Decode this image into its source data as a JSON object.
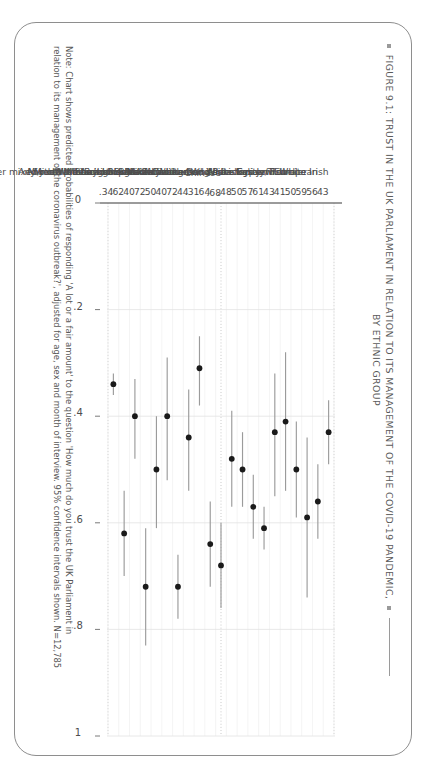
{
  "figure": {
    "title_line1": "FIGURE 9.1: TRUST IN THE UK PARLIAMENT IN RELATION TO ITS MANAGEMENT OF THE COVID-19 PANDEMIC,",
    "title_line2": "BY ETHNIC GROUP",
    "note_line1": "Note: Chart shows predicted probabilities of responding 'A lot or a fair amount' to the question 'How much do you trust the UK Parliament in",
    "note_line2": "relation to its management of the coronavirus outbreak?', adjusted for age, sex and month of interview. 95% confidence intervals shown. N=12,785",
    "colors": {
      "marker": "#1a1a1a",
      "whisker": "#9b9b9b",
      "axis": "#7a7a7a",
      "grid": "#d7d7d7",
      "gridline_dotted": "#bdbdbd",
      "text": "#4d4d4d",
      "frame": "#8e8e8e"
    }
  },
  "chart_data": {
    "type": "scatter",
    "title": "FIGURE 9.1: TRUST IN THE UK PARLIAMENT IN RELATION TO ITS MANAGEMENT OF THE COVID-19 PANDEMIC, BY ETHNIC GROUP",
    "xlabel": "",
    "ylabel": "",
    "orientation": "horizontal-dotplot",
    "ylim": [
      0,
      1
    ],
    "ytick_labels": [
      "0",
      ".2",
      ".4",
      ".6",
      ".8",
      "1"
    ],
    "ytick_values": [
      0,
      0.2,
      0.4,
      0.6,
      0.8,
      1
    ],
    "grid": true,
    "legend": "none",
    "value_label_format": "leading-dot",
    "categories": [
      "White Irish",
      "White Eastern European",
      "Gypsy/Traveller",
      "Roma",
      "Jewish",
      "Any other White background",
      "Indian",
      "Pakistani",
      "Bangladeshi",
      "Mixed White and Asian",
      "Chinese",
      "Any other Asian background",
      "Black Caribbean",
      "Mixed White and Black Caribbean",
      "Black African",
      "Mixed White and Black African",
      "Any other Black background",
      "Arab",
      "Any other mixed/multiple background",
      "Any other ethnic group",
      "White British"
    ],
    "values": [
      0.43,
      0.56,
      0.59,
      0.5,
      0.41,
      0.43,
      0.61,
      0.57,
      0.5,
      0.48,
      0.68,
      0.64,
      0.31,
      0.44,
      0.72,
      0.4,
      0.5,
      0.72,
      0.4,
      0.62,
      0.34
    ],
    "value_labels": [
      ".43",
      ".56",
      ".59",
      ".50",
      ".41",
      ".43",
      ".61",
      ".57",
      ".50",
      ".48",
      ".68",
      ".64",
      ".31",
      ".44",
      ".72",
      ".40",
      ".50",
      ".72",
      ".40",
      ".62",
      ".34"
    ],
    "ci_low": [
      0.37,
      0.49,
      0.44,
      0.41,
      0.28,
      0.32,
      0.57,
      0.51,
      0.43,
      0.39,
      0.6,
      0.56,
      0.25,
      0.35,
      0.66,
      0.29,
      0.4,
      0.61,
      0.33,
      0.54,
      0.32
    ],
    "ci_high": [
      0.49,
      0.63,
      0.74,
      0.59,
      0.54,
      0.55,
      0.65,
      0.63,
      0.57,
      0.57,
      0.76,
      0.72,
      0.38,
      0.54,
      0.78,
      0.52,
      0.61,
      0.83,
      0.48,
      0.7,
      0.36
    ]
  }
}
